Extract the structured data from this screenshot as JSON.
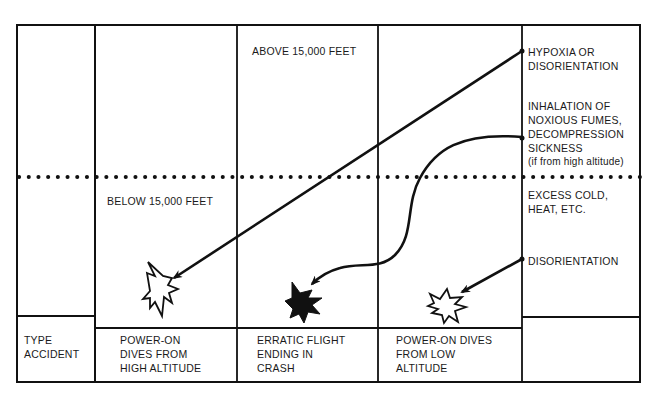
{
  "zones": {
    "above": "ABOVE 15,000 FEET",
    "below": "BELOW 15,000 FEET"
  },
  "causes": [
    {
      "id": "hypoxia",
      "text": "HYPOXIA OR\nDISORIENTATION"
    },
    {
      "id": "fumes",
      "text": "INHALATION OF\nNOXIOUS FUMES,\nDECOMPRESSION\nSICKNESS",
      "note": "(if from high altitude)"
    },
    {
      "id": "cold",
      "text": "EXCESS COLD,\nHEAT, ETC."
    },
    {
      "id": "disorientation",
      "text": "DISORIENTATION"
    }
  ],
  "footer": {
    "type_label": "TYPE\nACCIDENT",
    "accidents": [
      "POWER-ON\nDIVES FROM\nHIGH ALTITUDE",
      "ERRATIC FLIGHT\nENDING IN\nCRASH",
      "POWER-ON DIVES\nFROM LOW\nALTITUDE"
    ]
  }
}
